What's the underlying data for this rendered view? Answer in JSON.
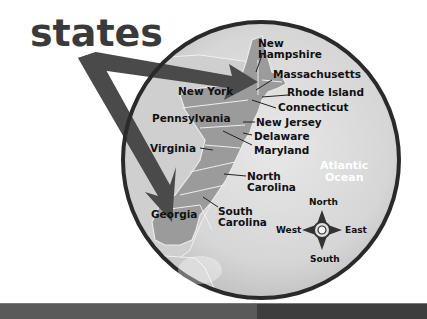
{
  "title": "states",
  "map": {
    "ocean_label_line1": "Atlantic",
    "ocean_label_line2": "Ocean",
    "states": [
      {
        "name": "New Hampshire",
        "line1": "New",
        "line2": "Hampshire"
      },
      {
        "name": "Massachusetts",
        "line1": "Massachusetts"
      },
      {
        "name": "New York",
        "line1": "New York"
      },
      {
        "name": "Rhode Island",
        "line1": "Rhode Island"
      },
      {
        "name": "Connecticut",
        "line1": "Connecticut"
      },
      {
        "name": "Pennsylvania",
        "line1": "Pennsylvania"
      },
      {
        "name": "New Jersey",
        "line1": "New Jersey"
      },
      {
        "name": "Delaware",
        "line1": "Delaware"
      },
      {
        "name": "Maryland",
        "line1": "Maryland"
      },
      {
        "name": "Virginia",
        "line1": "Virginia"
      },
      {
        "name": "North Carolina",
        "line1": "North",
        "line2": "Carolina"
      },
      {
        "name": "Georgia",
        "line1": "Georgia"
      },
      {
        "name": "South Carolina",
        "line1": "South",
        "line2": "Carolina"
      }
    ],
    "arrows": [
      {
        "from": "states",
        "to": "New York"
      },
      {
        "from": "states",
        "to": "Georgia"
      }
    ]
  },
  "compass": {
    "north": "North",
    "south": "South",
    "east": "East",
    "west": "West"
  },
  "colors": {
    "circle_border": "#2a2a2a",
    "circle_fill": "#d9d9d9",
    "land_highlight": "#9a9a9a",
    "land_other": "#c4c4c4",
    "arrow": "#4a4a4a",
    "title": "#3a3a3a"
  }
}
